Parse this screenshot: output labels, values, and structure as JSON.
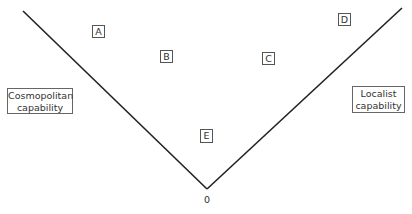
{
  "diagram": {
    "type": "v-shaped capability diagram",
    "axes": {
      "left_arm": {
        "label_line1": "Cosmopolitan",
        "label_line2": "capability",
        "from": [
          23,
          11
        ],
        "to": [
          207,
          189
        ]
      },
      "right_arm": {
        "label_line1": "Localist",
        "label_line2": "capability",
        "from": [
          207,
          189
        ],
        "to": [
          402,
          8
        ]
      },
      "origin_label": "0",
      "line_color": "#222222"
    },
    "points": [
      {
        "id": "A",
        "label": "A",
        "x": 92,
        "y": 25,
        "w": 13,
        "h": 13
      },
      {
        "id": "B",
        "label": "B",
        "x": 160,
        "y": 50,
        "w": 13,
        "h": 13
      },
      {
        "id": "C",
        "label": "C",
        "x": 262,
        "y": 52,
        "w": 13,
        "h": 13
      },
      {
        "id": "D",
        "label": "D",
        "x": 338,
        "y": 13,
        "w": 13,
        "h": 13
      },
      {
        "id": "E",
        "label": "E",
        "x": 200,
        "y": 129,
        "w": 13,
        "h": 14
      }
    ]
  }
}
